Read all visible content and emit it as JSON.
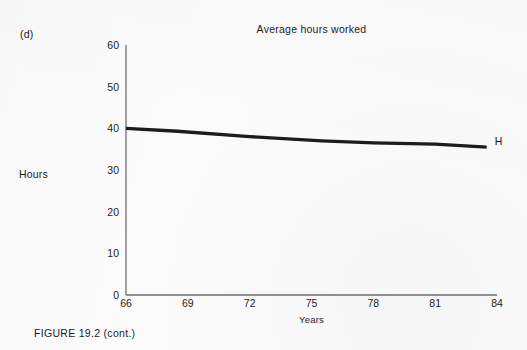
{
  "figure": {
    "panel_label": "(d)",
    "caption": "FIGURE 19.2 (cont.)"
  },
  "chart_data": {
    "type": "line",
    "title": "Average hours worked",
    "xlabel": "Years",
    "ylabel": "Hours",
    "grid": false,
    "legend_position": "line-end",
    "xlim": [
      66,
      84
    ],
    "ylim": [
      0,
      60
    ],
    "xticks": [
      "66",
      "69",
      "72",
      "75",
      "78",
      "81",
      "84"
    ],
    "xtick_values": [
      66,
      69,
      72,
      75,
      78,
      81,
      84
    ],
    "yticks": [
      "0",
      "10",
      "20",
      "30",
      "40",
      "50",
      "60"
    ],
    "ytick_values": [
      0,
      10,
      20,
      30,
      40,
      50,
      60
    ],
    "series": [
      {
        "name": "H",
        "end_label": "H",
        "color": "#1c1c1c",
        "x": [
          66,
          68.5,
          72,
          75.5,
          78,
          81,
          83.5
        ],
        "values": [
          40.0,
          39.3,
          38.0,
          37.0,
          36.5,
          36.2,
          35.5
        ]
      }
    ]
  },
  "axes": {
    "left_px": 126,
    "right_px": 497,
    "top_px": 45,
    "bottom_px": 295,
    "axis_color": "#6f6f6f"
  }
}
